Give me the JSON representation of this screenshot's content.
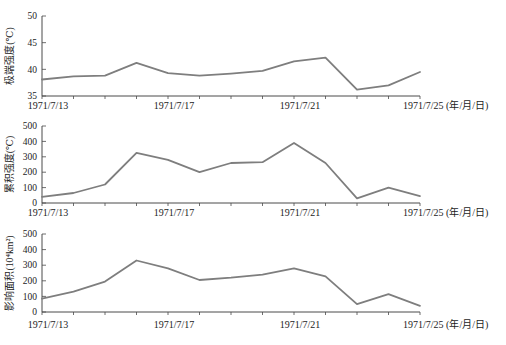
{
  "page": {
    "background_color": "#ffffff",
    "figure_description": "three stacked line charts of heat wave metrics over dates"
  },
  "chart_data": [
    {
      "type": "line",
      "panel": "top",
      "title": "",
      "ylabel": "极端强度(℃)",
      "xlabel": "",
      "x_unit_label": "(年/月/日)",
      "x": [
        "1971/7/13",
        "1971/7/14",
        "1971/7/15",
        "1971/7/16",
        "1971/7/17",
        "1971/7/18",
        "1971/7/19",
        "1971/7/20",
        "1971/7/21",
        "1971/7/22",
        "1971/7/23",
        "1971/7/24",
        "1971/7/25"
      ],
      "x_tick_labels": [
        "1971/7/13",
        "1971/7/17",
        "1971/7/21",
        "1971/7/25"
      ],
      "values": [
        38.1,
        38.7,
        38.8,
        41.2,
        39.3,
        38.8,
        39.2,
        39.7,
        41.5,
        42.2,
        36.2,
        37.0,
        39.5
      ],
      "ylim": [
        35,
        50
      ],
      "yticks": [
        35,
        40,
        45,
        50
      ],
      "grid": false,
      "legend": null,
      "line_color": "#7e7e7e",
      "axis_color": "#4a4a4a"
    },
    {
      "type": "line",
      "panel": "middle",
      "title": "",
      "ylabel": "累积强度(℃)",
      "xlabel": "",
      "x_unit_label": "(年/月/日)",
      "x": [
        "1971/7/13",
        "1971/7/14",
        "1971/7/15",
        "1971/7/16",
        "1971/7/17",
        "1971/7/18",
        "1971/7/19",
        "1971/7/20",
        "1971/7/21",
        "1971/7/22",
        "1971/7/23",
        "1971/7/24",
        "1971/7/25"
      ],
      "x_tick_labels": [
        "1971/7/13",
        "1971/7/17",
        "1971/7/21",
        "1971/7/25"
      ],
      "values": [
        40,
        65,
        120,
        325,
        280,
        200,
        260,
        265,
        390,
        260,
        30,
        100,
        45
      ],
      "ylim": [
        0,
        500
      ],
      "yticks": [
        0,
        100,
        200,
        300,
        400,
        500
      ],
      "grid": false,
      "legend": null,
      "line_color": "#7e7e7e",
      "axis_color": "#4a4a4a"
    },
    {
      "type": "line",
      "panel": "bottom",
      "title": "",
      "ylabel": "影响面积(10⁴km²)",
      "xlabel": "",
      "x_unit_label": "(年/月/日)",
      "x": [
        "1971/7/13",
        "1971/7/14",
        "1971/7/15",
        "1971/7/16",
        "1971/7/17",
        "1971/7/18",
        "1971/7/19",
        "1971/7/20",
        "1971/7/21",
        "1971/7/22",
        "1971/7/23",
        "1971/7/24",
        "1971/7/25"
      ],
      "x_tick_labels": [
        "1971/7/13",
        "1971/7/17",
        "1971/7/21",
        "1971/7/25"
      ],
      "values": [
        85,
        130,
        195,
        330,
        280,
        205,
        220,
        240,
        280,
        228,
        50,
        115,
        40
      ],
      "ylim": [
        0,
        500
      ],
      "yticks": [
        0,
        100,
        200,
        300,
        400,
        500
      ],
      "grid": false,
      "legend": null,
      "line_color": "#7e7e7e",
      "axis_color": "#4a4a4a"
    }
  ]
}
